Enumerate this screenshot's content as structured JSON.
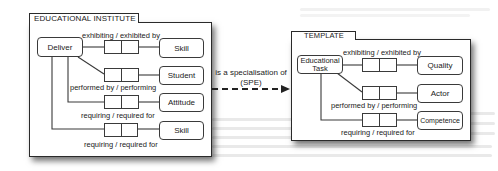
{
  "left_panel": {
    "title": "EDUCATIONAL INSTITUTE",
    "source_node": "Deliver",
    "relations": [
      {
        "label": "exhibiting / exhibited by",
        "target": "Skill"
      },
      {
        "label": "performed by / performing",
        "target": "Student"
      },
      {
        "label": "requiring / required for",
        "target": "Attitude"
      },
      {
        "label": "requiring / required for",
        "target": "Skill"
      }
    ]
  },
  "arrow": {
    "label_line1": "is a specialisation of",
    "label_line2": "(SPE)",
    "style": "dashed"
  },
  "right_panel": {
    "title": "TEMPLATE",
    "source_node": "Educational Task",
    "relations": [
      {
        "label": "exhibiting / exhibited by",
        "target": "Quality"
      },
      {
        "label": "performed by / performing",
        "target": "Actor"
      },
      {
        "label": "requiring / required for",
        "target": "Competence"
      }
    ]
  }
}
